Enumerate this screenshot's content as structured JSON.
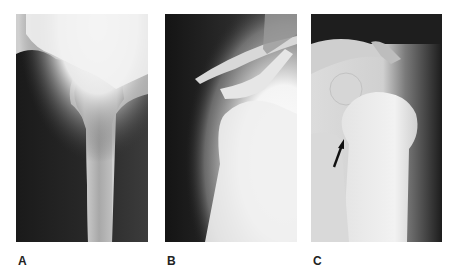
{
  "figure": {
    "panels": [
      {
        "label": "A",
        "description": "radiograph-proximal-femur"
      },
      {
        "label": "B",
        "description": "radiograph-shoulder"
      },
      {
        "label": "C",
        "description": "radiograph-shoulder-with-arrow"
      }
    ]
  }
}
